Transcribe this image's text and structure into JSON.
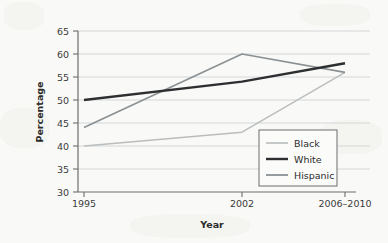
{
  "chart_data": {
    "type": "line",
    "title": "",
    "xlabel": "Year",
    "ylabel": "Percentage",
    "categories": [
      "1995",
      "2002",
      "2006–2010"
    ],
    "ylim": [
      30,
      65
    ],
    "yticks": [
      "30",
      "35",
      "40",
      "45",
      "50",
      "55",
      "60",
      "65"
    ],
    "grid": true,
    "legend_position": "lower-right-inside",
    "series": [
      {
        "name": "Black",
        "values": [
          40,
          43,
          56
        ],
        "color": "#b9bdbd",
        "width": 1.4
      },
      {
        "name": "White",
        "values": [
          50,
          54,
          58
        ],
        "color": "#2d2f31",
        "width": 2.4
      },
      {
        "name": "Hispanic",
        "values": [
          44,
          60,
          56
        ],
        "color": "#8b9193",
        "width": 1.6
      }
    ]
  },
  "legend": {
    "items": [
      {
        "label": "Black"
      },
      {
        "label": "White"
      },
      {
        "label": "Hispanic"
      }
    ]
  },
  "axes": {
    "y_label": "Percentage",
    "x_label": "Year",
    "y_tick_0": "30",
    "y_tick_1": "35",
    "y_tick_2": "40",
    "y_tick_3": "45",
    "y_tick_4": "50",
    "y_tick_5": "55",
    "y_tick_6": "60",
    "y_tick_7": "65",
    "x_tick_0": "1995",
    "x_tick_1": "2002",
    "x_tick_2": "2006–2010"
  },
  "colors": {
    "background": "#f9f9f7",
    "axis": "#6b6f70",
    "grid": "#d4d7d8",
    "text": "#2b2b2b",
    "black_series": "#b9bdbd",
    "white_series": "#2d2f31",
    "hispanic_series": "#8b9193"
  }
}
